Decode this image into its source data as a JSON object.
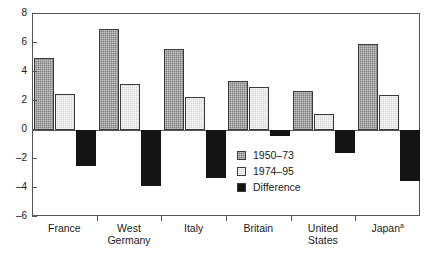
{
  "chart_data": {
    "type": "bar",
    "title": "",
    "subtitle": "",
    "xlabel": "",
    "ylabel": "",
    "ylim": [
      -6,
      8
    ],
    "ytick_labels": [
      "8",
      "6",
      "4",
      "2",
      "0",
      "-2",
      "-4",
      "-6"
    ],
    "ytick_values": [
      8,
      6,
      4,
      2,
      0,
      -2,
      -4,
      -6
    ],
    "grid": false,
    "legend_position": "inside-lower-center",
    "categories": [
      "France",
      "West\nGermany",
      "Italy",
      "Britain",
      "United\nStates",
      "Japan"
    ],
    "category_superscripts": [
      "",
      "",
      "",
      "",
      "",
      "a"
    ],
    "series": [
      {
        "name": "1950–73",
        "values": [
          5.0,
          7.0,
          5.6,
          3.4,
          2.7,
          5.9
        ]
      },
      {
        "name": "1974–95",
        "values": [
          2.5,
          3.2,
          2.3,
          3.0,
          1.1,
          2.4
        ]
      },
      {
        "name": "Difference",
        "values": [
          -2.5,
          -3.85,
          -3.3,
          -0.4,
          -1.6,
          -3.5
        ]
      }
    ]
  },
  "legend": {
    "items": [
      {
        "label": "1950–73",
        "color": "#808080"
      },
      {
        "label": "1974–95",
        "color": "#d4d4d4"
      },
      {
        "label": "Difference",
        "color": "#141414"
      }
    ]
  },
  "axes": {
    "y_ticks": [
      "8",
      "6",
      "4",
      "2",
      "0",
      "-2",
      "-4",
      "-6"
    ],
    "x_labels": [
      "France",
      "West\nGermany",
      "Italy",
      "Britain",
      "United\nStates",
      "Japan"
    ]
  },
  "colors": {
    "series_a": "#808080",
    "series_b": "#d4d4d4",
    "series_c": "#141414",
    "axis": "#555555",
    "background": "#ffffff"
  }
}
